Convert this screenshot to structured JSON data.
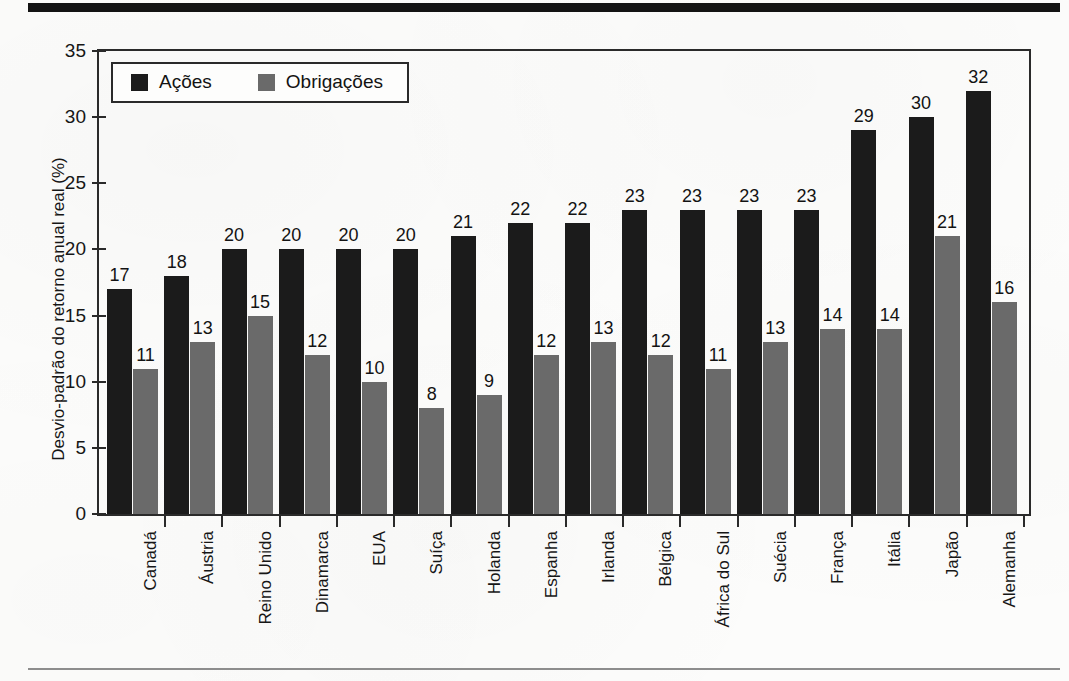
{
  "figure": {
    "background_color": "#fcfcfb",
    "top_rule_color": "#131313",
    "bottom_rule_color": "#8d8d8d"
  },
  "legend": {
    "position": "top-left-inside",
    "entries": [
      {
        "label": "Ações",
        "color": "#1b1b1b",
        "swatch_name": "equities-swatch"
      },
      {
        "label": "Obrigações",
        "color": "#6a6a6a",
        "swatch_name": "bonds-swatch"
      }
    ]
  },
  "chart_data": {
    "type": "bar",
    "title": "",
    "subtitle": "",
    "xlabel": "",
    "ylabel": "Desvio-padrão do retorno anual real (%)",
    "ylim": [
      0,
      35
    ],
    "ytick_labels": [
      "0",
      "5",
      "10",
      "15",
      "20",
      "25",
      "30",
      "35"
    ],
    "ytick_values": [
      0,
      5,
      10,
      15,
      20,
      25,
      30,
      35
    ],
    "grid": false,
    "legend_position": "top-left",
    "categories": [
      "Canadá",
      "Áustria",
      "Reino Unido",
      "Dinamarca",
      "EUA",
      "Suíça",
      "Holanda",
      "Espanha",
      "Irlanda",
      "Bélgica",
      "África do Sul",
      "Suécia",
      "França",
      "Itália",
      "Japão",
      "Alemanha"
    ],
    "series": [
      {
        "name": "Ações",
        "color": "#1b1b1b",
        "values": [
          17,
          18,
          20,
          20,
          20,
          20,
          21,
          22,
          22,
          23,
          23,
          23,
          23,
          29,
          30,
          32
        ]
      },
      {
        "name": "Obrigações",
        "color": "#6a6a6a",
        "values": [
          11,
          13,
          15,
          12,
          10,
          8,
          9,
          12,
          13,
          12,
          11,
          13,
          14,
          14,
          21,
          16
        ]
      }
    ],
    "data_labels_shown": true
  }
}
